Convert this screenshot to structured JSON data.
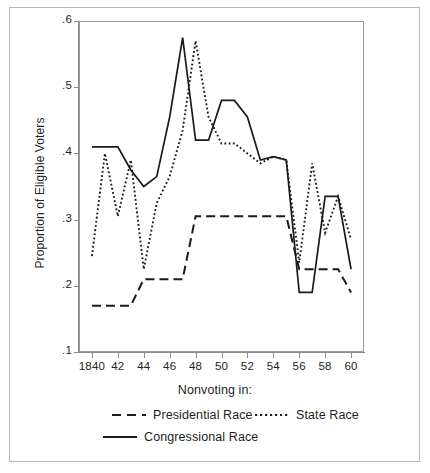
{
  "chart_data": {
    "type": "line",
    "title": "",
    "xlabel": "Nonvoting in:",
    "ylabel": "Proportion of Eligible Voters",
    "xlim": [
      1839,
      1861
    ],
    "ylim": [
      0.1,
      0.6
    ],
    "ytick_labels": [
      ".6",
      ".5",
      ".4",
      ".3",
      ".2",
      ".1"
    ],
    "ytick_values": [
      0.6,
      0.5,
      0.4,
      0.3,
      0.2,
      0.1
    ],
    "xtick_labels": [
      "1840",
      "42",
      "44",
      "46",
      "48",
      "50",
      "52",
      "54",
      "56",
      "58",
      "60"
    ],
    "xtick_values": [
      1840,
      1842,
      1844,
      1846,
      1848,
      1850,
      1852,
      1854,
      1856,
      1858,
      1860
    ],
    "grid": false,
    "legend_position": "below-axis",
    "x": [
      1840,
      1841,
      1842,
      1843,
      1844,
      1845,
      1846,
      1847,
      1848,
      1849,
      1850,
      1851,
      1852,
      1853,
      1854,
      1855,
      1856,
      1857,
      1858,
      1859,
      1860
    ],
    "series": [
      {
        "name": "Presidential Race",
        "style": "dashed",
        "color": "#1a1a1a",
        "values": [
          0.17,
          0.17,
          0.17,
          0.17,
          0.21,
          0.21,
          0.21,
          0.21,
          0.305,
          0.305,
          0.305,
          0.305,
          0.305,
          0.305,
          0.305,
          0.305,
          0.225,
          0.225,
          0.225,
          0.225,
          0.19
        ]
      },
      {
        "name": "State Race",
        "style": "dotted",
        "color": "#1a1a1a",
        "values": [
          0.245,
          0.4,
          0.305,
          0.39,
          0.225,
          0.325,
          0.365,
          0.435,
          0.57,
          0.455,
          0.415,
          0.415,
          0.4,
          0.385,
          0.395,
          0.39,
          0.235,
          0.385,
          0.28,
          0.335,
          0.27
        ]
      },
      {
        "name": "Congressional Race",
        "style": "solid",
        "color": "#1a1a1a",
        "values": [
          0.41,
          0.41,
          0.41,
          0.375,
          0.35,
          0.365,
          0.455,
          0.575,
          0.42,
          0.42,
          0.48,
          0.48,
          0.455,
          0.39,
          0.395,
          0.39,
          0.19,
          0.19,
          0.335,
          0.335,
          0.225
        ]
      }
    ]
  },
  "axis": {
    "y_title": "Proportion of Eligible Voters",
    "x_title": "Nonvoting in:"
  },
  "legend": {
    "entries": [
      {
        "label": "Presidential Race",
        "style": "dashed"
      },
      {
        "label": "State Race",
        "style": "dotted"
      },
      {
        "label": "Congressional Race",
        "style": "solid"
      }
    ]
  }
}
